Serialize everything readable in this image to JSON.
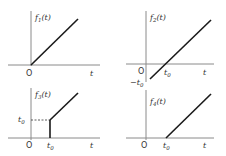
{
  "panels": [
    {
      "id": "f1",
      "title": "f1(t)",
      "title_main": "f",
      "title_sub": "1",
      "title_arg": "(t)",
      "origin_label": "O",
      "t_label": "t"
    },
    {
      "id": "f2",
      "title": "f2(t)",
      "title_main": "f",
      "title_sub": "2",
      "title_arg": "(t)",
      "origin_label": "O",
      "t_label": "t",
      "tick_label": "t0",
      "tick_main": "t",
      "tick_sub": "0",
      "neg_label": "−t0",
      "neg_main": "−t",
      "neg_sub": "0"
    },
    {
      "id": "f3",
      "title": "f3(t)",
      "title_main": "f",
      "title_sub": "3",
      "title_arg": "(t)",
      "origin_label": "O",
      "t_label": "t",
      "tick_main": "t",
      "tick_sub": "0",
      "y_tick_main": "t",
      "y_tick_sub": "0"
    },
    {
      "id": "f4",
      "title": "f4(t)",
      "title_main": "f",
      "title_sub": "4",
      "title_arg": "(t)",
      "origin_label": "O",
      "t_label": "t",
      "tick_main": "t",
      "tick_sub": "0"
    }
  ]
}
